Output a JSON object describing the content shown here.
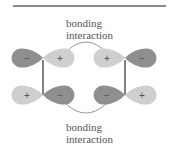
{
  "diagram": {
    "top_label": {
      "line1": "bonding",
      "line2": "interaction"
    },
    "bottom_label": {
      "line1": "bonding",
      "line2": "interaction"
    },
    "colors": {
      "dark_lobe": "#8f8f8f",
      "light_lobe": "#cfcfcf",
      "rule": "#8a8a8a",
      "bond": "#333333",
      "arc": "#9a9a9a",
      "sign": "#555555"
    },
    "orbitals": [
      {
        "position": "top-left",
        "left_sign": "−",
        "right_sign": "+"
      },
      {
        "position": "top-right",
        "left_sign": "+",
        "right_sign": "−"
      },
      {
        "position": "bottom-left",
        "left_sign": "+",
        "right_sign": "−"
      },
      {
        "position": "bottom-right",
        "left_sign": "−",
        "right_sign": "+"
      }
    ]
  }
}
